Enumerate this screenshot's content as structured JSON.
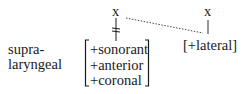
{
  "diagram": {
    "type": "autosegmental-feature-geometry",
    "tier_label": {
      "line1": "supra-",
      "line2": "laryngeal"
    },
    "nodes": {
      "left_x": "x",
      "right_x": "x"
    },
    "left_matrix": {
      "features": [
        "+sonorant",
        "+anterior",
        "+coronal"
      ]
    },
    "right_matrix": {
      "label": "[+lateral]"
    },
    "links": [
      {
        "from": "left_x",
        "to": "left_matrix",
        "style": "solid",
        "delinked": true
      },
      {
        "from": "right_x",
        "to": "right_matrix",
        "style": "solid"
      },
      {
        "from": "left_x",
        "to": "right_matrix",
        "style": "dotted"
      }
    ],
    "colors": {
      "ink": "#1a1a1a",
      "background": "#ffffff"
    }
  }
}
